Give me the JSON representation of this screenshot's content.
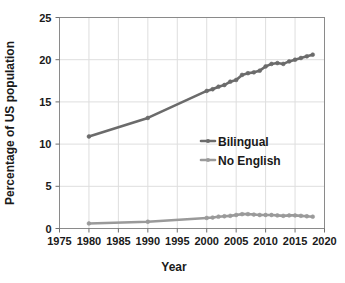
{
  "chart_data": {
    "type": "line",
    "title": "",
    "xlabel": "Year",
    "ylabel": "Percentage of US population",
    "xlim": [
      1975,
      2020
    ],
    "ylim": [
      0,
      25
    ],
    "xticks": [
      1975,
      1980,
      1985,
      1990,
      1995,
      2000,
      2005,
      2010,
      2015,
      2020
    ],
    "yticks": [
      0,
      5,
      10,
      15,
      20,
      25
    ],
    "grid": true,
    "legend_position": "center-right",
    "series": [
      {
        "name": "Bilingual",
        "color": "#6b6b6b",
        "marker": "circle",
        "x": [
          1980,
          1990,
          2000,
          2001,
          2002,
          2003,
          2004,
          2005,
          2006,
          2007,
          2008,
          2009,
          2010,
          2011,
          2012,
          2013,
          2014,
          2015,
          2016,
          2017,
          2018
        ],
        "values": [
          10.9,
          13.1,
          16.3,
          16.5,
          16.8,
          17.0,
          17.4,
          17.6,
          18.2,
          18.4,
          18.5,
          18.7,
          19.2,
          19.5,
          19.6,
          19.5,
          19.8,
          20.0,
          20.2,
          20.4,
          20.6
        ]
      },
      {
        "name": "No English",
        "color": "#9a9a9a",
        "marker": "circle",
        "x": [
          1980,
          1990,
          2000,
          2001,
          2002,
          2003,
          2004,
          2005,
          2006,
          2007,
          2008,
          2009,
          2010,
          2011,
          2012,
          2013,
          2014,
          2015,
          2016,
          2017,
          2018
        ],
        "values": [
          0.6,
          0.8,
          1.25,
          1.3,
          1.4,
          1.45,
          1.5,
          1.6,
          1.7,
          1.7,
          1.65,
          1.6,
          1.6,
          1.6,
          1.55,
          1.5,
          1.55,
          1.55,
          1.5,
          1.45,
          1.4
        ]
      }
    ],
    "legend": [
      {
        "label": "Bilingual",
        "color": "#6b6b6b"
      },
      {
        "label": "No English",
        "color": "#9a9a9a"
      }
    ],
    "axis_color": "#8a8a8a",
    "grid_color": "#dedede",
    "text_color": "#1a1a1a"
  }
}
